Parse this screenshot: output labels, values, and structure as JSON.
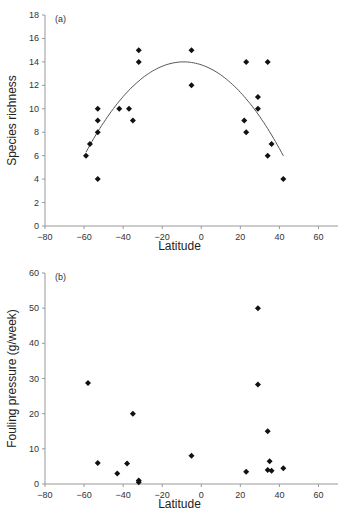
{
  "chart_data": [
    {
      "type": "scatter",
      "panel_label": "(a)",
      "title": "",
      "xlabel": "Latitude",
      "ylabel": "Species richness",
      "xlim": [
        -80,
        70
      ],
      "ylim": [
        0,
        18
      ],
      "xticks": [
        -80,
        -60,
        -40,
        -20,
        0,
        20,
        40,
        60
      ],
      "yticks": [
        0,
        2,
        4,
        6,
        8,
        10,
        12,
        14,
        16,
        18
      ],
      "grid": false,
      "legend": null,
      "marker": "diamond",
      "points": [
        [
          -59,
          6
        ],
        [
          -57,
          7
        ],
        [
          -53,
          8
        ],
        [
          -53,
          9
        ],
        [
          -53,
          10
        ],
        [
          -53,
          4
        ],
        [
          -42,
          10
        ],
        [
          -37,
          10
        ],
        [
          -35,
          9
        ],
        [
          -32,
          14
        ],
        [
          -32,
          15
        ],
        [
          -5,
          15
        ],
        [
          -5,
          12
        ],
        [
          22,
          9
        ],
        [
          23,
          8
        ],
        [
          23,
          14
        ],
        [
          29,
          10
        ],
        [
          29,
          11
        ],
        [
          34,
          14
        ],
        [
          34,
          6
        ],
        [
          36,
          7
        ],
        [
          42,
          4
        ]
      ],
      "fit_curve": {
        "type": "quadratic",
        "x_range": [
          -59,
          42
        ],
        "vertex": [
          -9,
          14
        ],
        "endpoints": [
          [
            -59,
            6.3
          ],
          [
            42,
            6
          ]
        ]
      }
    },
    {
      "type": "scatter",
      "panel_label": "(b)",
      "title": "",
      "xlabel": "Latitude",
      "ylabel": "Fouling pressure (g/week)",
      "xlim": [
        -80,
        70
      ],
      "ylim": [
        0,
        60
      ],
      "xticks": [
        -80,
        -60,
        -40,
        -20,
        0,
        20,
        40,
        60
      ],
      "yticks": [
        0,
        10,
        20,
        30,
        40,
        50,
        60
      ],
      "grid": false,
      "legend": null,
      "marker": "diamond",
      "points": [
        [
          -58,
          28.7
        ],
        [
          -53,
          6
        ],
        [
          -43,
          3
        ],
        [
          -38,
          5.8
        ],
        [
          -35,
          20
        ],
        [
          -32,
          1
        ],
        [
          -32,
          0.5
        ],
        [
          -5,
          8
        ],
        [
          23,
          3.5
        ],
        [
          29,
          50
        ],
        [
          29,
          28.3
        ],
        [
          34,
          15
        ],
        [
          34,
          4
        ],
        [
          35,
          6.5
        ],
        [
          36,
          3.8
        ],
        [
          42,
          4.5
        ]
      ]
    }
  ]
}
